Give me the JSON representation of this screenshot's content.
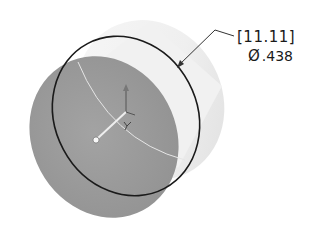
{
  "diagram": {
    "type": "cad-isometric-part",
    "part": "cylinder",
    "dimension": {
      "kind": "diameter",
      "primary_label": "[11.11]",
      "symbol": "Ø",
      "secondary_value": ".438"
    },
    "colors": {
      "background": "#ffffff",
      "face_front": "#9a9a9a",
      "face_side_light": "#f4f4f4",
      "edge_selected": "#1a1a1a",
      "leader_line": "#333333",
      "triad_axis": "#e8e8e8",
      "triad_arrow": "#555555"
    }
  }
}
